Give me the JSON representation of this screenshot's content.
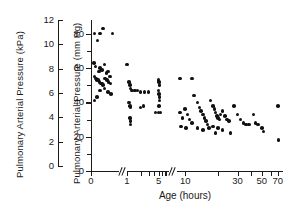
{
  "chart_data": {
    "type": "scatter",
    "title": "",
    "xlabel": "Age (hours)",
    "ylabel": "Pulmonary Arterial Pressure (kPa)",
    "ylabel2": "Pulmonary Arterial Pressure (mm Hg)",
    "grid": false,
    "legend": "none",
    "axis_breaks": 2,
    "y_left": {
      "label": "Pulmonary Arterial Pressure (kPa)",
      "unit": "kPa",
      "min": 0,
      "max": 12,
      "step": 2,
      "ticks": [
        0,
        2,
        4,
        6,
        8,
        10,
        12
      ],
      "ticklabels": [
        "0",
        "2",
        "4",
        "6",
        "8",
        "10",
        "12"
      ]
    },
    "y_right": {
      "label": "Pulmonary Arterial Pressure (mm Hg)",
      "unit": "mm Hg",
      "min": 0,
      "max": 88,
      "major_ticks": [
        0,
        20,
        40,
        60,
        80
      ],
      "minor_ticks": [
        10,
        30,
        50,
        70
      ],
      "ticklabels": [
        "0",
        "20",
        "40",
        "60",
        "80"
      ]
    },
    "x_axis": {
      "label": "Age (hours)",
      "unit": "hours",
      "segments": [
        {
          "name": "birth",
          "ticklabels": [
            "0"
          ],
          "ticks": [
            0
          ]
        },
        {
          "name": "early",
          "ticklabels": [
            "1",
            "5"
          ],
          "ticks": [
            1,
            2,
            3,
            4,
            5,
            6,
            7
          ]
        },
        {
          "name": "late",
          "ticklabels": [
            "10",
            "30",
            "50",
            "70"
          ],
          "ticks": [
            10,
            20,
            30,
            40,
            50,
            60,
            70
          ]
        }
      ],
      "all_ticklabels": [
        "0",
        "1",
        "5",
        "10",
        "30",
        "50",
        "70"
      ]
    },
    "points": [
      {
        "x": 0.12,
        "y": 80
      },
      {
        "x": 0.3,
        "y": 80
      },
      {
        "x": 0.22,
        "y": 76
      },
      {
        "x": 0.4,
        "y": 83
      },
      {
        "x": 0.7,
        "y": 80
      },
      {
        "x": 0.1,
        "y": 63
      },
      {
        "x": 0.14,
        "y": 61
      },
      {
        "x": 0.26,
        "y": 58
      },
      {
        "x": 0.3,
        "y": 60
      },
      {
        "x": 0.36,
        "y": 59
      },
      {
        "x": 0.44,
        "y": 62
      },
      {
        "x": 0.5,
        "y": 57
      },
      {
        "x": 0.56,
        "y": 58
      },
      {
        "x": 0.62,
        "y": 55
      },
      {
        "x": 0.12,
        "y": 55
      },
      {
        "x": 0.16,
        "y": 54
      },
      {
        "x": 0.2,
        "y": 53
      },
      {
        "x": 0.24,
        "y": 53
      },
      {
        "x": 0.28,
        "y": 52
      },
      {
        "x": 0.32,
        "y": 51
      },
      {
        "x": 0.36,
        "y": 51
      },
      {
        "x": 0.4,
        "y": 50
      },
      {
        "x": 0.46,
        "y": 54
      },
      {
        "x": 0.52,
        "y": 53
      },
      {
        "x": 0.58,
        "y": 52
      },
      {
        "x": 0.64,
        "y": 51
      },
      {
        "x": 0.3,
        "y": 47
      },
      {
        "x": 0.44,
        "y": 48
      },
      {
        "x": 0.56,
        "y": 46
      },
      {
        "x": 0.66,
        "y": 45
      },
      {
        "x": 0.12,
        "y": 41
      },
      {
        "x": 0.2,
        "y": 43
      },
      {
        "x": 1.0,
        "y": 62
      },
      {
        "x": 1.1,
        "y": 52
      },
      {
        "x": 1.15,
        "y": 50
      },
      {
        "x": 1.2,
        "y": 48
      },
      {
        "x": 1.3,
        "y": 47
      },
      {
        "x": 1.5,
        "y": 47
      },
      {
        "x": 1.7,
        "y": 47
      },
      {
        "x": 2.0,
        "y": 46
      },
      {
        "x": 2.4,
        "y": 46
      },
      {
        "x": 3.0,
        "y": 46
      },
      {
        "x": 1.1,
        "y": 40
      },
      {
        "x": 1.15,
        "y": 38
      },
      {
        "x": 1.2,
        "y": 37
      },
      {
        "x": 2.0,
        "y": 37
      },
      {
        "x": 2.3,
        "y": 38
      },
      {
        "x": 1.15,
        "y": 31
      },
      {
        "x": 1.18,
        "y": 29
      },
      {
        "x": 1.2,
        "y": 27
      },
      {
        "x": 5.0,
        "y": 53
      },
      {
        "x": 5.1,
        "y": 52
      },
      {
        "x": 5.2,
        "y": 50
      },
      {
        "x": 5.0,
        "y": 47
      },
      {
        "x": 5.1,
        "y": 45
      },
      {
        "x": 5.15,
        "y": 43
      },
      {
        "x": 5.2,
        "y": 41
      },
      {
        "x": 4.2,
        "y": 34
      },
      {
        "x": 5.0,
        "y": 34
      },
      {
        "x": 5.5,
        "y": 34
      },
      {
        "x": 5.1,
        "y": 38
      },
      {
        "x": 9.0,
        "y": 54
      },
      {
        "x": 11.5,
        "y": 54
      },
      {
        "x": 9.0,
        "y": 34
      },
      {
        "x": 9.5,
        "y": 31
      },
      {
        "x": 10.0,
        "y": 36
      },
      {
        "x": 10.5,
        "y": 33
      },
      {
        "x": 11.0,
        "y": 30
      },
      {
        "x": 11.5,
        "y": 28
      },
      {
        "x": 9.2,
        "y": 26
      },
      {
        "x": 10.2,
        "y": 25
      },
      {
        "x": 12.0,
        "y": 44
      },
      {
        "x": 13.0,
        "y": 40
      },
      {
        "x": 13.5,
        "y": 37
      },
      {
        "x": 14.0,
        "y": 35
      },
      {
        "x": 14.5,
        "y": 33
      },
      {
        "x": 15.0,
        "y": 31
      },
      {
        "x": 15.5,
        "y": 29
      },
      {
        "x": 16.0,
        "y": 27
      },
      {
        "x": 13.0,
        "y": 25
      },
      {
        "x": 14.5,
        "y": 24
      },
      {
        "x": 16.5,
        "y": 25
      },
      {
        "x": 17.0,
        "y": 41
      },
      {
        "x": 18.0,
        "y": 38
      },
      {
        "x": 18.5,
        "y": 36
      },
      {
        "x": 19.0,
        "y": 34
      },
      {
        "x": 19.5,
        "y": 32
      },
      {
        "x": 20.0,
        "y": 31
      },
      {
        "x": 20.5,
        "y": 30
      },
      {
        "x": 21.0,
        "y": 33
      },
      {
        "x": 22.0,
        "y": 35
      },
      {
        "x": 23.0,
        "y": 32
      },
      {
        "x": 24.0,
        "y": 30
      },
      {
        "x": 25.0,
        "y": 29
      },
      {
        "x": 18.0,
        "y": 26
      },
      {
        "x": 20.0,
        "y": 25
      },
      {
        "x": 22.0,
        "y": 24
      },
      {
        "x": 19.0,
        "y": 22
      },
      {
        "x": 26.0,
        "y": 22
      },
      {
        "x": 28.0,
        "y": 38
      },
      {
        "x": 30.0,
        "y": 33
      },
      {
        "x": 32.0,
        "y": 30
      },
      {
        "x": 34.0,
        "y": 28
      },
      {
        "x": 36.0,
        "y": 27
      },
      {
        "x": 38.0,
        "y": 27
      },
      {
        "x": 42.0,
        "y": 33
      },
      {
        "x": 44.0,
        "y": 28
      },
      {
        "x": 46.0,
        "y": 27
      },
      {
        "x": 50.0,
        "y": 25
      },
      {
        "x": 52.0,
        "y": 23
      },
      {
        "x": 70.0,
        "y": 38
      },
      {
        "x": 71.0,
        "y": 18
      }
    ],
    "n_points": 113,
    "point_color": "#111111",
    "axis_color": "#1a1a1a"
  }
}
